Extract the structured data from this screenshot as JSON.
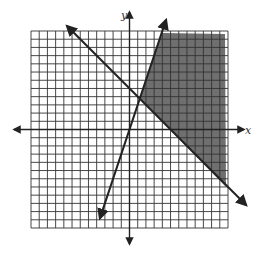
{
  "chart_data": {
    "type": "line",
    "title": "",
    "xlabel": "x",
    "ylabel": "y",
    "xlim": [
      -12,
      12
    ],
    "ylim": [
      -12,
      12
    ],
    "grid": true,
    "grid_step": 1,
    "lines": [
      {
        "name": "boundary-steep",
        "equation": "y = 3x",
        "slope": 3,
        "intercept": 0,
        "style": "solid",
        "arrows": true
      },
      {
        "name": "boundary-decreasing",
        "equation": "y = -x + 5",
        "slope": -1,
        "intercept": 5,
        "style": "solid",
        "arrows": true
      }
    ],
    "shaded_region": {
      "description": "Region right of the steep line and above the decreasing line",
      "inequalities": [
        "y <= 3x",
        "y >= -x + 5"
      ],
      "color": "#707070"
    },
    "intersection": {
      "x": 1.25,
      "y": 3.75
    }
  },
  "labels": {
    "x_axis": "x",
    "y_axis": "y"
  },
  "colors": {
    "grid": "#333333",
    "axis": "#222222",
    "line": "#222222",
    "shade": "#6f6f6f",
    "background": "#ffffff"
  }
}
